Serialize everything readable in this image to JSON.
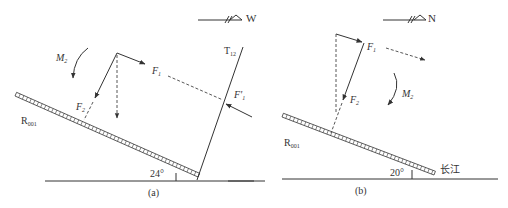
{
  "panels": [
    {
      "id": "a",
      "caption": "(a)",
      "direction_label": "W",
      "angle_label": "24°",
      "plane_label": "R",
      "plane_sub": "001",
      "fault_label": "T",
      "fault_sub": "12",
      "force_F1": "F",
      "force_F1_sub": "1",
      "force_F1prime": "F'",
      "force_F1prime_sub": "1",
      "force_F2": "F",
      "force_F2_sub": "2",
      "moment": "M",
      "moment_sub": "2"
    },
    {
      "id": "b",
      "caption": "(b)",
      "direction_label": "N",
      "angle_label": "20°",
      "plane_label": "R",
      "plane_sub": "001",
      "river_label": "长江",
      "force_F1": "F",
      "force_F1_sub": "1",
      "force_F2": "F",
      "force_F2_sub": "2",
      "moment": "M",
      "moment_sub": "2"
    }
  ]
}
